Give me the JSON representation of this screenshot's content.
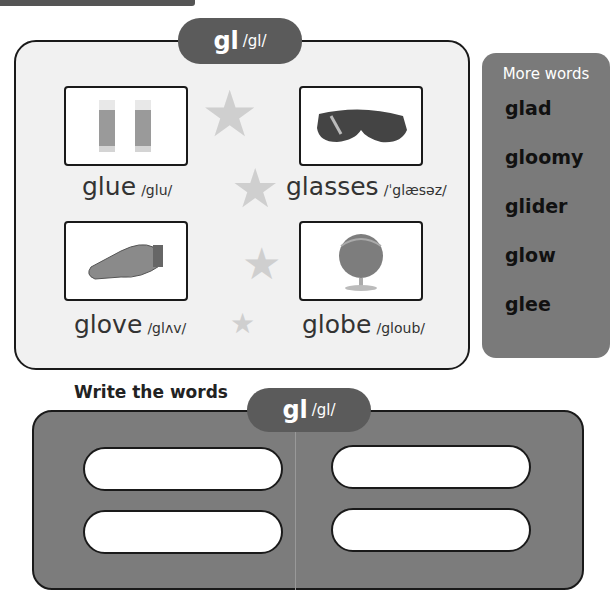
{
  "header": {
    "phonics_label": "gl",
    "phonics_ipa": "/gl/"
  },
  "items": [
    {
      "word": "glue",
      "ipa": "/glu/",
      "icon": "glue-stick-icon"
    },
    {
      "word": "glasses",
      "ipa": "/ˈglæsəz/",
      "icon": "glasses-icon"
    },
    {
      "word": "glove",
      "ipa": "/glʌv/",
      "icon": "glove-icon"
    },
    {
      "word": "globe",
      "ipa": "/gloub/",
      "icon": "globe-icon"
    }
  ],
  "more_words": {
    "title": "More words",
    "words": [
      "glad",
      "gloomy",
      "glider",
      "glow",
      "glee"
    ]
  },
  "write": {
    "title": "Write the words",
    "phonics_label": "gl",
    "phonics_ipa": "/gl/",
    "fields": [
      "",
      "",
      "",
      ""
    ]
  },
  "colors": {
    "pill": "#5b5b5b",
    "panel": "#7a7a7a",
    "card": "#f1f1f1"
  }
}
